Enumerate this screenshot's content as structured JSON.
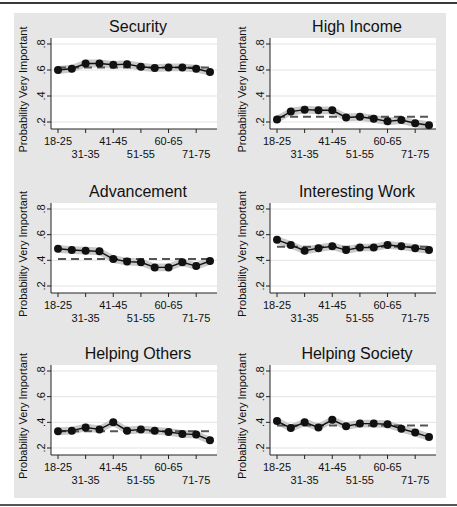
{
  "figure": {
    "background": "#e6e6e6",
    "plot_background": "#ffffff",
    "band_color": "#c9c9c9",
    "line_color": "#111111",
    "mean_line_color": "#555555",
    "gridline_color": "#e3e3e3"
  },
  "chart_data": [
    {
      "type": "line",
      "title": "Security",
      "xlabel": "",
      "ylabel": "Probability Very Important",
      "categories": [
        "18-25",
        "26-30",
        "31-35",
        "36-40",
        "41-45",
        "46-50",
        "51-55",
        "56-59",
        "60-65",
        "66-70",
        "71-75",
        "76+"
      ],
      "tick_labels_row1": [
        "18-25",
        "41-45",
        "60-65"
      ],
      "tick_labels_row2": [
        "31-35",
        "51-55",
        "71-75"
      ],
      "yticks": [
        ".2",
        ".4",
        ".6",
        ".8"
      ],
      "ylim": [
        0.15,
        0.85
      ],
      "grid": true,
      "series": [
        {
          "name": "Predicted probability",
          "values": [
            0.6,
            0.61,
            0.65,
            0.65,
            0.64,
            0.645,
            0.625,
            0.615,
            0.62,
            0.62,
            0.61,
            0.585
          ]
        }
      ],
      "mean_line": 0.62,
      "ci_halfwidth": 0.03
    },
    {
      "type": "line",
      "title": "High Income",
      "xlabel": "",
      "ylabel": "Probability Very Important",
      "categories": [
        "18-25",
        "26-30",
        "31-35",
        "36-40",
        "41-45",
        "46-50",
        "51-55",
        "56-59",
        "60-65",
        "66-70",
        "71-75",
        "76+"
      ],
      "tick_labels_row1": [
        "18-25",
        "41-45",
        "60-65"
      ],
      "tick_labels_row2": [
        "31-35",
        "51-55",
        "71-75"
      ],
      "yticks": [
        ".2",
        ".4",
        ".6",
        ".8"
      ],
      "ylim": [
        0.15,
        0.85
      ],
      "grid": true,
      "series": [
        {
          "name": "Predicted probability",
          "values": [
            0.22,
            0.28,
            0.295,
            0.29,
            0.29,
            0.235,
            0.24,
            0.225,
            0.205,
            0.215,
            0.19,
            0.175
          ]
        }
      ],
      "mean_line": 0.24,
      "ci_halfwidth": 0.03
    },
    {
      "type": "line",
      "title": "Advancement",
      "xlabel": "",
      "ylabel": "Probability Very Important",
      "categories": [
        "18-25",
        "26-30",
        "31-35",
        "36-40",
        "41-45",
        "46-50",
        "51-55",
        "56-59",
        "60-65",
        "66-70",
        "71-75",
        "76+"
      ],
      "tick_labels_row1": [
        "18-25",
        "41-45",
        "60-65"
      ],
      "tick_labels_row2": [
        "31-35",
        "51-55",
        "71-75"
      ],
      "yticks": [
        ".2",
        ".4",
        ".6",
        ".8"
      ],
      "ylim": [
        0.15,
        0.85
      ],
      "grid": true,
      "series": [
        {
          "name": "Predicted probability",
          "values": [
            0.49,
            0.48,
            0.475,
            0.47,
            0.41,
            0.39,
            0.385,
            0.345,
            0.345,
            0.385,
            0.355,
            0.395
          ]
        }
      ],
      "mean_line": 0.41,
      "ci_halfwidth": 0.03
    },
    {
      "type": "line",
      "title": "Interesting Work",
      "xlabel": "",
      "ylabel": "Probability Very Important",
      "categories": [
        "18-25",
        "26-30",
        "31-35",
        "36-40",
        "41-45",
        "46-50",
        "51-55",
        "56-59",
        "60-65",
        "66-70",
        "71-75",
        "76+"
      ],
      "tick_labels_row1": [
        "18-25",
        "41-45",
        "60-65"
      ],
      "tick_labels_row2": [
        "31-35",
        "51-55",
        "71-75"
      ],
      "yticks": [
        ".2",
        ".4",
        ".6",
        ".8"
      ],
      "ylim": [
        0.15,
        0.85
      ],
      "grid": true,
      "series": [
        {
          "name": "Predicted probability",
          "values": [
            0.56,
            0.52,
            0.475,
            0.495,
            0.51,
            0.48,
            0.5,
            0.5,
            0.52,
            0.51,
            0.495,
            0.48
          ]
        }
      ],
      "mean_line": 0.505,
      "ci_halfwidth": 0.03
    },
    {
      "type": "line",
      "title": "Helping Others",
      "xlabel": "",
      "ylabel": "Probability Very Important",
      "categories": [
        "18-25",
        "26-30",
        "31-35",
        "36-40",
        "41-45",
        "46-50",
        "51-55",
        "56-59",
        "60-65",
        "66-70",
        "71-75",
        "76+"
      ],
      "tick_labels_row1": [
        "18-25",
        "41-45",
        "60-65"
      ],
      "tick_labels_row2": [
        "31-35",
        "51-55",
        "71-75"
      ],
      "yticks": [
        ".2",
        ".4",
        ".6",
        ".8"
      ],
      "ylim": [
        0.15,
        0.85
      ],
      "grid": true,
      "series": [
        {
          "name": "Predicted probability",
          "values": [
            0.33,
            0.335,
            0.36,
            0.345,
            0.4,
            0.335,
            0.345,
            0.335,
            0.325,
            0.31,
            0.305,
            0.26
          ]
        }
      ],
      "mean_line": 0.33,
      "ci_halfwidth": 0.03
    },
    {
      "type": "line",
      "title": "Helping Society",
      "xlabel": "",
      "ylabel": "Probability Very Important",
      "categories": [
        "18-25",
        "26-30",
        "31-35",
        "36-40",
        "41-45",
        "46-50",
        "51-55",
        "56-59",
        "60-65",
        "66-70",
        "71-75",
        "76+"
      ],
      "tick_labels_row1": [
        "18-25",
        "41-45",
        "60-65"
      ],
      "tick_labels_row2": [
        "31-35",
        "51-55",
        "71-75"
      ],
      "yticks": [
        ".2",
        ".4",
        ".6",
        ".8"
      ],
      "ylim": [
        0.15,
        0.85
      ],
      "grid": true,
      "series": [
        {
          "name": "Predicted probability",
          "values": [
            0.41,
            0.355,
            0.4,
            0.36,
            0.42,
            0.37,
            0.39,
            0.39,
            0.385,
            0.35,
            0.32,
            0.285
          ]
        }
      ],
      "mean_line": 0.375,
      "ci_halfwidth": 0.03
    }
  ]
}
